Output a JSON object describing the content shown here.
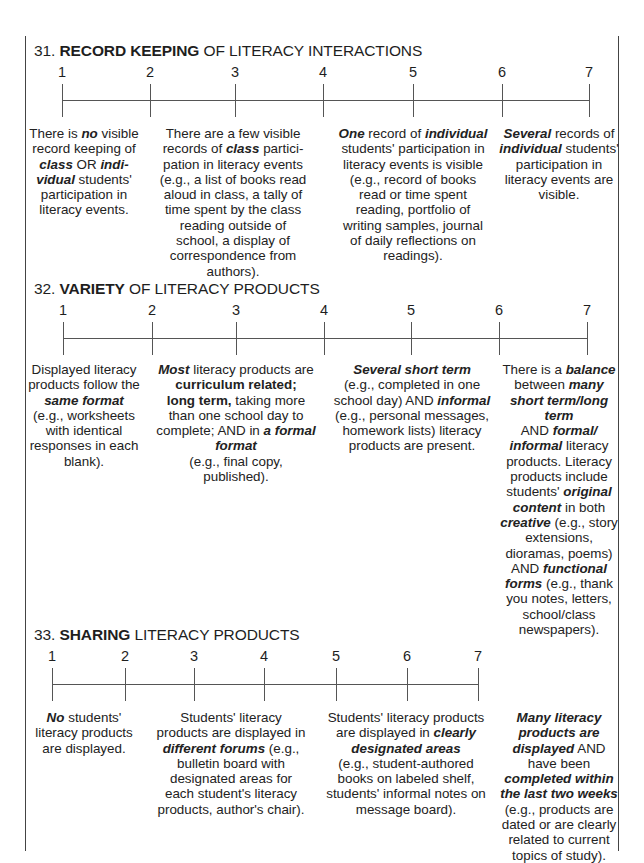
{
  "items": [
    {
      "number": "31.",
      "title_bold": "RECORD KEEPING",
      "title_rest": " OF LITERACY INTERACTIONS",
      "scale": [
        "1",
        "2",
        "3",
        "4",
        "5",
        "6",
        "7"
      ],
      "anchors": [
        {
          "point": "1",
          "html": "There is <i>no</i> visible record keeping of <i>class</i> OR <i>indi-vidual</i> students' participation in literacy events."
        },
        {
          "point": "3",
          "html": "There are a few visible records of <i>class</i> partici-pation in literacy events (e.g., a list of books read aloud in class, a tally of time spent by the class reading outside of school, a display of correspondence from authors)."
        },
        {
          "point": "5",
          "html": "<i>One</i> record of <i>individual</i> students' participation in literacy events is visible (e.g., record of books read or time spent reading, portfolio of writing samples, journal of daily reflections on readings)."
        },
        {
          "point": "7",
          "html": "<i>Several</i> records of <i>individual</i> students' participation in literacy events are visible."
        }
      ]
    },
    {
      "number": "32.",
      "title_bold": "VARIETY",
      "title_rest": " OF LITERACY PRODUCTS",
      "scale": [
        "1",
        "2",
        "3",
        "4",
        "5",
        "6",
        "7"
      ],
      "anchors": [
        {
          "point": "1",
          "html": "Displayed literacy products follow the <i>same format</i> (e.g., worksheets with identical responses in each blank)."
        },
        {
          "point": "3",
          "html": "<i>Most</i> literacy products are <b>curriculum related;</b><br><b>long term,</b> taking more than one school day to complete; AND in <i>a formal format</i><br>(e.g., final copy, published)."
        },
        {
          "point": "5",
          "html": "<i>Several short term</i><br>(e.g., completed in one school day) AND <i>informal</i> (e.g., personal messages, homework lists) literacy products are present."
        },
        {
          "point": "7",
          "html": "There is a <i>balance</i> between <i>many short term/long term</i><br>AND <i>formal/ informal</i> literacy products. Literacy products include students' <i>original content</i> in both <i>creative</i> (e.g., story extensions, dioramas, poems) AND <i>functional forms</i> (e.g., thank you notes, letters, school/class newspapers)."
        }
      ]
    },
    {
      "number": "33.",
      "title_bold": "SHARING",
      "title_rest": " LITERACY PRODUCTS",
      "scale": [
        "1",
        "2",
        "3",
        "4",
        "5",
        "6",
        "7"
      ],
      "anchors": [
        {
          "point": "1",
          "html": "<i>No</i> students' literacy products are displayed."
        },
        {
          "point": "3",
          "html": "Students' literacy products are displayed in <i>different forums</i> (e.g., bulletin board with designated areas for each student's literacy products, author's chair)."
        },
        {
          "point": "5",
          "html": "Students' literacy products are displayed in <i>clearly designated areas</i><br>(e.g., student-authored books on labeled shelf, students' informal notes on message board)."
        },
        {
          "point": "7",
          "html": "<i>Many literacy products are displayed</i> AND have been <i>completed within the last two weeks</i> (e.g., products are dated or are clearly related to current topics of study)."
        }
      ]
    }
  ]
}
